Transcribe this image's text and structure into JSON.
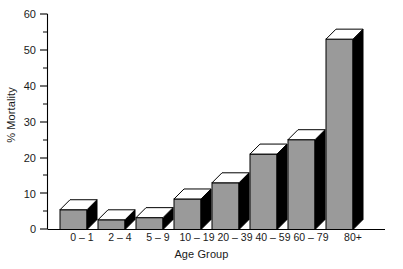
{
  "chart_data": {
    "type": "bar",
    "title": "",
    "subtitle": "",
    "xlabel": "Age Group",
    "ylabel": "% Mortality",
    "categories": [
      "0 – 1",
      "2 – 4",
      "5 – 9",
      "10 – 19",
      "20 – 39",
      "40 – 59",
      "60 – 79",
      "80+"
    ],
    "values": [
      5.5,
      2.7,
      3.3,
      8.5,
      13.0,
      21.0,
      25.0,
      53.0
    ],
    "series": [
      {
        "name": "% Mortality",
        "values": [
          5.5,
          2.7,
          3.3,
          8.5,
          13.0,
          21.0,
          25.0,
          53.0
        ]
      }
    ],
    "ylim": [
      0,
      60
    ],
    "xlim_note": "categorical",
    "y_ticks_major": [
      0,
      10,
      20,
      30,
      40,
      50,
      60
    ],
    "y_tick_labels": [
      "0",
      "10",
      "20",
      "30",
      "40",
      "50",
      "60"
    ],
    "y_ticks_minor": [
      5,
      15,
      25,
      35,
      45,
      55
    ],
    "grid": false,
    "legend": false,
    "legend_position": "none",
    "style": "3d-bar",
    "colors": {
      "bar_front": "#9a9a9a",
      "bar_side": "#000000",
      "bar_top": "#ffffff",
      "axis": "#000000",
      "text": "#1a1a1a",
      "background": "#ffffff"
    },
    "annotations": []
  },
  "caption": {
    "text": ""
  }
}
